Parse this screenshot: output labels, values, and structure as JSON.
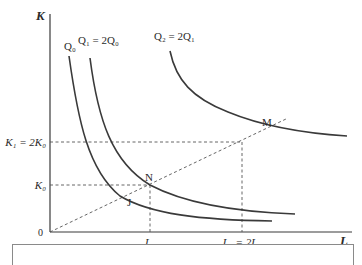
{
  "diagram": {
    "type": "isoquant-map",
    "axes": {
      "y_label": "K",
      "x_label": "L",
      "origin_label": "0"
    },
    "y_ticks": [
      {
        "label": "K₁ = 2K₀",
        "name": "K1"
      },
      {
        "label": "K₀",
        "name": "K0"
      }
    ],
    "x_ticks": [
      {
        "label": "L₀",
        "name": "L0"
      },
      {
        "label": "L₁ = 2L₀",
        "name": "L1"
      }
    ],
    "isoquants": [
      {
        "label": "Q₀",
        "name": "Q0"
      },
      {
        "label": "Q₁ = 2Q₀",
        "name": "Q1"
      },
      {
        "label": "Q₂ = 2Q₁",
        "name": "Q2"
      }
    ],
    "points": [
      {
        "label": "J",
        "description": "Q0 on expansion ray"
      },
      {
        "label": "N",
        "description": "Q1 at (L0, K0)"
      },
      {
        "label": "M",
        "description": "Q2 on expansion ray"
      }
    ],
    "ray": "dashed ray from origin through J, N, M"
  }
}
